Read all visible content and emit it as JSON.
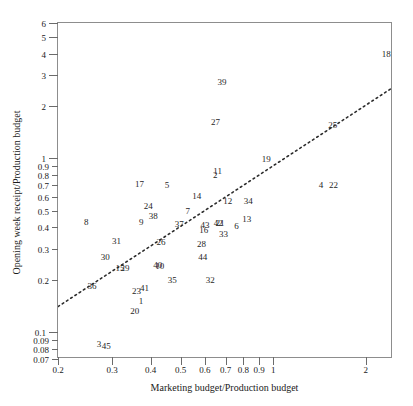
{
  "chart_data": {
    "type": "scatter",
    "title": "",
    "xlabel": "Marketing budget/Production budget",
    "ylabel": "Opening week receipt/Production budget",
    "xscale": "log",
    "yscale": "log",
    "xlim": [
      0.2,
      2.45
    ],
    "ylim": [
      0.07,
      6.0
    ],
    "grid": false,
    "legend": null,
    "point_style": "numeric-label",
    "xticks": [
      {
        "value": 0.2,
        "label": "0.2",
        "major": true
      },
      {
        "value": 0.3,
        "label": "0.3",
        "major": true
      },
      {
        "value": 0.4,
        "label": "0.4",
        "major": true
      },
      {
        "value": 0.5,
        "label": "0.5",
        "major": true
      },
      {
        "value": 0.6,
        "label": "0.6",
        "major": true
      },
      {
        "value": 0.7,
        "label": "0.7",
        "major": true
      },
      {
        "value": 0.8,
        "label": "0.8",
        "major": true
      },
      {
        "value": 0.9,
        "label": "0.9",
        "major": true
      },
      {
        "value": 1.0,
        "label": "1",
        "major": true
      },
      {
        "value": 2.0,
        "label": "2",
        "major": true
      }
    ],
    "yticks": [
      {
        "value": 6,
        "label": "6",
        "major": true
      },
      {
        "value": 5,
        "label": "5",
        "major": true
      },
      {
        "value": 4,
        "label": "4",
        "major": true
      },
      {
        "value": 3,
        "label": "3",
        "major": true
      },
      {
        "value": 2,
        "label": "2",
        "major": true
      },
      {
        "value": 1,
        "label": "1",
        "major": true
      },
      {
        "value": 0.9,
        "label": "0.9",
        "major": false
      },
      {
        "value": 0.8,
        "label": "0.8",
        "major": false
      },
      {
        "value": 0.7,
        "label": "0.7",
        "major": false
      },
      {
        "value": 0.6,
        "label": "0.6",
        "major": false
      },
      {
        "value": 0.5,
        "label": "0.5",
        "major": false
      },
      {
        "value": 0.4,
        "label": "0.4",
        "major": false
      },
      {
        "value": 0.3,
        "label": "0.3",
        "major": false
      },
      {
        "value": 0.2,
        "label": "0.2",
        "major": false
      },
      {
        "value": 0.1,
        "label": "0.1",
        "major": true
      },
      {
        "value": 0.09,
        "label": "0.09",
        "major": false
      },
      {
        "value": 0.08,
        "label": "0.08",
        "major": false
      },
      {
        "value": 0.07,
        "label": "0.07",
        "major": false
      }
    ],
    "trend_line": {
      "style": "dotted",
      "color": "#2b2b2b",
      "x0": 0.2,
      "y0": 0.137,
      "x1": 2.45,
      "y1": 2.5
    },
    "points": [
      {
        "label": "1",
        "x": 0.372,
        "y": 0.151
      },
      {
        "label": "2",
        "x": 0.648,
        "y": 0.8
      },
      {
        "label": "3",
        "x": 0.272,
        "y": 0.0855
      },
      {
        "label": "4",
        "x": 1.43,
        "y": 0.7
      },
      {
        "label": "5",
        "x": 0.452,
        "y": 0.705
      },
      {
        "label": "6",
        "x": 0.76,
        "y": 0.405
      },
      {
        "label": "7",
        "x": 0.528,
        "y": 0.5
      },
      {
        "label": "8",
        "x": 0.247,
        "y": 0.43
      },
      {
        "label": "9",
        "x": 0.373,
        "y": 0.428
      },
      {
        "label": "10",
        "x": 0.428,
        "y": 0.24
      },
      {
        "label": "11",
        "x": 0.66,
        "y": 0.84
      },
      {
        "label": "12",
        "x": 0.712,
        "y": 0.565
      },
      {
        "label": "13",
        "x": 0.82,
        "y": 0.45
      },
      {
        "label": "14",
        "x": 0.565,
        "y": 0.605
      },
      {
        "label": "15",
        "x": 0.318,
        "y": 0.233
      },
      {
        "label": "16",
        "x": 0.595,
        "y": 0.385
      },
      {
        "label": "17",
        "x": 0.368,
        "y": 0.71
      },
      {
        "label": "18",
        "x": 2.33,
        "y": 4.0
      },
      {
        "label": "19",
        "x": 0.95,
        "y": 0.99
      },
      {
        "label": "20",
        "x": 0.355,
        "y": 0.133
      },
      {
        "label": "21",
        "x": 0.672,
        "y": 0.425
      },
      {
        "label": "22",
        "x": 1.57,
        "y": 0.7
      },
      {
        "label": "23",
        "x": 0.36,
        "y": 0.172
      },
      {
        "label": "24",
        "x": 0.393,
        "y": 0.53
      },
      {
        "label": "25",
        "x": 1.56,
        "y": 1.55
      },
      {
        "label": "26",
        "x": 0.432,
        "y": 0.328
      },
      {
        "label": "27",
        "x": 0.65,
        "y": 1.62
      },
      {
        "label": "28",
        "x": 0.585,
        "y": 0.32
      },
      {
        "label": "29",
        "x": 0.33,
        "y": 0.233
      },
      {
        "label": "30",
        "x": 0.285,
        "y": 0.272
      },
      {
        "label": "31",
        "x": 0.31,
        "y": 0.335
      },
      {
        "label": "32",
        "x": 0.625,
        "y": 0.2
      },
      {
        "label": "33",
        "x": 0.69,
        "y": 0.365
      },
      {
        "label": "34",
        "x": 0.83,
        "y": 0.565
      },
      {
        "label": "35",
        "x": 0.47,
        "y": 0.2
      },
      {
        "label": "36",
        "x": 0.258,
        "y": 0.183
      },
      {
        "label": "37",
        "x": 0.495,
        "y": 0.418
      },
      {
        "label": "38",
        "x": 0.408,
        "y": 0.468
      },
      {
        "label": "39",
        "x": 0.682,
        "y": 2.75
      },
      {
        "label": "40",
        "x": 0.422,
        "y": 0.243
      },
      {
        "label": "41",
        "x": 0.382,
        "y": 0.18
      },
      {
        "label": "42",
        "x": 0.663,
        "y": 0.425
      },
      {
        "label": "43",
        "x": 0.6,
        "y": 0.415
      },
      {
        "label": "44",
        "x": 0.59,
        "y": 0.272
      },
      {
        "label": "45",
        "x": 0.287,
        "y": 0.083
      }
    ]
  }
}
